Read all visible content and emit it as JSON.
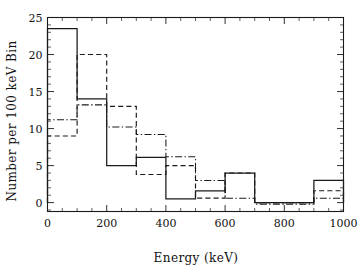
{
  "chart_data": {
    "type": "line",
    "title": "",
    "subtitle": "",
    "xlabel": "Energy (keV)",
    "ylabel": "Number per 100 keV Bin",
    "xlim": [
      0,
      1000
    ],
    "ylim": [
      -1.2,
      25
    ],
    "xticks": [
      0,
      200,
      400,
      600,
      800,
      1000
    ],
    "xtick_labels": [
      "0",
      "200",
      "400",
      "600",
      "800",
      "1000"
    ],
    "yticks": [
      0,
      5,
      10,
      15,
      20,
      25
    ],
    "ytick_labels": [
      "0",
      "5",
      "10",
      "15",
      "20",
      "25"
    ],
    "x_minor_tick_step": 50,
    "y_minor_tick_step": 1,
    "grid": false,
    "legend": "none",
    "bin_width": 100,
    "bin_edges": [
      0,
      100,
      200,
      300,
      400,
      500,
      600,
      700,
      800,
      900,
      1000
    ],
    "bin_centers": [
      50,
      150,
      250,
      350,
      450,
      550,
      650,
      750,
      850,
      950
    ],
    "drawstyle": "steps-post",
    "series": [
      {
        "name": "solid",
        "linestyle": "solid",
        "color": "#1a1a1a",
        "values": [
          23.5,
          14.0,
          5.0,
          6.1,
          0.5,
          1.6,
          4.0,
          0.0,
          0.0,
          3.0
        ]
      },
      {
        "name": "dashed",
        "linestyle": "dashed",
        "color": "#1a1a1a",
        "values": [
          9.0,
          20.0,
          13.0,
          3.8,
          5.0,
          0.6,
          4.0,
          0.0,
          0.0,
          1.6
        ]
      },
      {
        "name": "dash-dot",
        "linestyle": "dashdot",
        "color": "#1a1a1a",
        "values": [
          11.2,
          13.2,
          10.2,
          9.2,
          6.2,
          3.0,
          0.6,
          -0.2,
          -0.2,
          0.6
        ]
      }
    ]
  }
}
